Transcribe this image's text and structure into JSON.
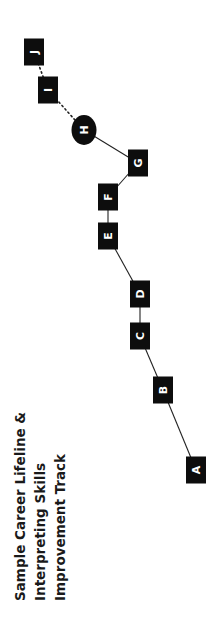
{
  "title": {
    "lines": [
      "Sample Career Lifeline &",
      "Interpreting Skills",
      "Improvement Track"
    ]
  },
  "colors": {
    "node_fill": "#0d0d0d",
    "node_text": "#ffffff",
    "edge": "#222222",
    "title": "#1a1a1a"
  },
  "nodes": [
    {
      "id": "A",
      "label": "A",
      "shape": "rect",
      "cx": 196,
      "cy": 470
    },
    {
      "id": "B",
      "label": "B",
      "shape": "rect",
      "cx": 163,
      "cy": 390
    },
    {
      "id": "C",
      "label": "C",
      "shape": "rect",
      "cx": 140,
      "cy": 336
    },
    {
      "id": "D",
      "label": "D",
      "shape": "rect",
      "cx": 140,
      "cy": 294
    },
    {
      "id": "E",
      "label": "E",
      "shape": "rect",
      "cx": 108,
      "cy": 236
    },
    {
      "id": "F",
      "label": "F",
      "shape": "rect",
      "cx": 108,
      "cy": 197
    },
    {
      "id": "G",
      "label": "G",
      "shape": "rect",
      "cx": 138,
      "cy": 163
    },
    {
      "id": "H",
      "label": "H",
      "shape": "ellipse",
      "cx": 84,
      "cy": 130
    },
    {
      "id": "I",
      "label": "I",
      "shape": "rect",
      "cx": 48,
      "cy": 90
    },
    {
      "id": "J",
      "label": "J",
      "shape": "rect",
      "cx": 34,
      "cy": 52
    }
  ],
  "edges": [
    {
      "from": "A",
      "to": "B",
      "style": "solid"
    },
    {
      "from": "B",
      "to": "C",
      "style": "solid"
    },
    {
      "from": "C",
      "to": "D",
      "style": "solid"
    },
    {
      "from": "D",
      "to": "E",
      "style": "solid"
    },
    {
      "from": "E",
      "to": "F",
      "style": "solid"
    },
    {
      "from": "F",
      "to": "G",
      "style": "solid"
    },
    {
      "from": "G",
      "to": "H",
      "style": "solid"
    },
    {
      "from": "H",
      "to": "I",
      "style": "dotted"
    },
    {
      "from": "I",
      "to": "J",
      "style": "dotted"
    }
  ]
}
